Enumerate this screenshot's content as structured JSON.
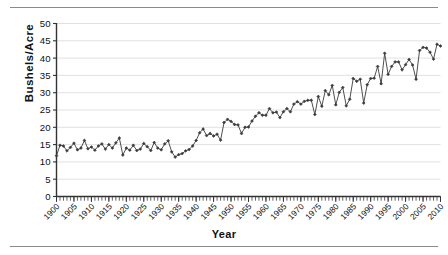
{
  "chart_data": {
    "type": "line",
    "title": "",
    "xlabel": "Year",
    "ylabel": "Bushels/Acre",
    "xlim": [
      1900,
      2010
    ],
    "ylim": [
      0,
      50
    ],
    "ytick_step": 5,
    "xtick_step": 5,
    "xminor_step": 1,
    "grid": true,
    "grid_axis": "y",
    "legend": "none",
    "marker": "diamond",
    "line_color": "#3b3b3b",
    "marker_color": "#3b3b3b",
    "grid_color": "#d9d9d9",
    "axis_color": "#333333",
    "yticks": [
      0,
      5,
      10,
      15,
      20,
      25,
      30,
      35,
      40,
      45,
      50
    ],
    "xticks": [
      1900,
      1905,
      1910,
      1915,
      1920,
      1925,
      1930,
      1935,
      1940,
      1945,
      1950,
      1955,
      1960,
      1965,
      1970,
      1975,
      1980,
      1985,
      1990,
      1995,
      2000,
      2005,
      2010
    ],
    "x": [
      1900,
      1901,
      1902,
      1903,
      1904,
      1905,
      1906,
      1907,
      1908,
      1909,
      1910,
      1911,
      1912,
      1913,
      1914,
      1915,
      1916,
      1917,
      1918,
      1919,
      1920,
      1921,
      1922,
      1923,
      1924,
      1925,
      1926,
      1927,
      1928,
      1929,
      1930,
      1931,
      1932,
      1933,
      1934,
      1935,
      1936,
      1937,
      1938,
      1939,
      1940,
      1941,
      1942,
      1943,
      1944,
      1945,
      1946,
      1947,
      1948,
      1949,
      1950,
      1951,
      1952,
      1953,
      1954,
      1955,
      1956,
      1957,
      1958,
      1959,
      1960,
      1961,
      1962,
      1963,
      1964,
      1965,
      1966,
      1967,
      1968,
      1969,
      1970,
      1971,
      1972,
      1973,
      1974,
      1975,
      1976,
      1977,
      1978,
      1979,
      1980,
      1981,
      1982,
      1983,
      1984,
      1985,
      1986,
      1987,
      1988,
      1989,
      1990,
      1991,
      1992,
      1993,
      1994,
      1995,
      1996,
      1997,
      1998,
      1999,
      2000,
      2001,
      2002,
      2003,
      2004,
      2005,
      2006,
      2007,
      2008,
      2009,
      2010
    ],
    "values": [
      11.8,
      14.8,
      14.6,
      13.2,
      14.2,
      15.4,
      13.5,
      14.0,
      16.2,
      13.8,
      14.3,
      13.4,
      14.6,
      15.2,
      13.7,
      15.0,
      14.0,
      15.5,
      16.9,
      12.0,
      14.0,
      13.4,
      14.8,
      13.3,
      13.7,
      15.3,
      14.4,
      13.3,
      15.6,
      14.0,
      13.5,
      15.2,
      16.1,
      12.9,
      11.4,
      12.1,
      12.4,
      13.2,
      13.6,
      14.6,
      16.2,
      18.4,
      19.5,
      17.6,
      18.2,
      17.5,
      18.0,
      16.3,
      21.4,
      22.3,
      21.7,
      20.8,
      20.7,
      18.2,
      20.0,
      20.1,
      21.8,
      23.2,
      24.2,
      23.5,
      23.5,
      25.4,
      24.2,
      24.4,
      22.8,
      24.5,
      25.4,
      24.5,
      26.7,
      27.4,
      26.7,
      27.5,
      27.8,
      27.8,
      23.7,
      28.9,
      26.1,
      30.6,
      29.4,
      32.1,
      26.5,
      30.1,
      31.5,
      26.2,
      28.1,
      34.1,
      33.3,
      33.9,
      27.0,
      32.3,
      34.1,
      34.2,
      37.6,
      32.6,
      41.4,
      35.3,
      37.6,
      38.9,
      38.9,
      36.6,
      38.1,
      39.6,
      38.0,
      33.9,
      42.2,
      43.1,
      42.9,
      41.7,
      39.7,
      44.0,
      43.5
    ]
  }
}
